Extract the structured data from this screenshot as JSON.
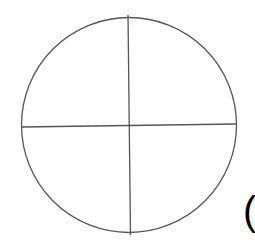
{
  "diagram": {
    "shape": "circle-divided-into-quarters",
    "stroke_color": "#555555",
    "background": "#ffffff",
    "circle": {
      "cx": 129,
      "cy": 125,
      "r": 107.5
    },
    "vertical_divider": {
      "x1": 128,
      "y1": 15,
      "x2": 130.5,
      "y2": 235
    },
    "horizontal_divider": {
      "x1": 21.5,
      "y1": 127,
      "x2": 236,
      "y2": 124
    }
  },
  "edge_text": {
    "glyph": "(",
    "color": "#000000"
  }
}
